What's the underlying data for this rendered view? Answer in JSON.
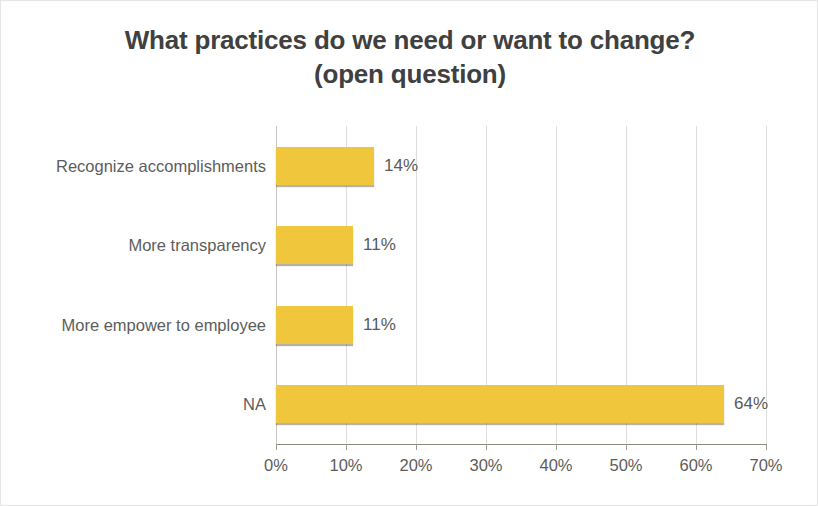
{
  "chart_data": {
    "type": "bar",
    "orientation": "horizontal",
    "title": "What practices do we need or want to change?",
    "subtitle": "(open question)",
    "title_line1": "What practices do we need or want to change?",
    "title_line2": "(open question)",
    "categories": [
      "Recognize accomplishments",
      "More transparency",
      "More empower to employee",
      "NA"
    ],
    "values": [
      14,
      11,
      11,
      64
    ],
    "value_labels": [
      "14%",
      "11%",
      "11%",
      "64%"
    ],
    "xlabel": "",
    "ylabel": "",
    "xlim": [
      0,
      70
    ],
    "x_ticks": [
      0,
      10,
      20,
      30,
      40,
      50,
      60,
      70
    ],
    "x_tick_labels": [
      "0%",
      "10%",
      "20%",
      "30%",
      "40%",
      "50%",
      "60%",
      "70%"
    ],
    "grid": true,
    "grid_axis": "x",
    "legend": false,
    "series_color": "#f0c73c",
    "title_color": "#404040",
    "label_color": "#5d5d5d",
    "gridline_color": "#dedede",
    "axis_color": "#8c8a80",
    "background": "#ffffff"
  }
}
